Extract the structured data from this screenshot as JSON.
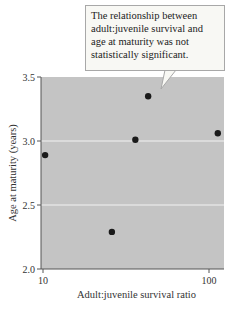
{
  "chart_data": {
    "type": "scatter",
    "title": "",
    "xlabel": "Adult:juvenile survival ratio",
    "ylabel": "Age at maturity (years)",
    "xscale": "log",
    "xlim": [
      10,
      120
    ],
    "ylim": [
      2.0,
      3.5
    ],
    "xticks": [
      10,
      100
    ],
    "xtick_labels": [
      "10",
      "100"
    ],
    "yticks": [
      2.0,
      2.5,
      3.0,
      3.5
    ],
    "ytick_labels": [
      "2.0",
      "2.5",
      "3.0",
      "3.5"
    ],
    "grid": "horizontal at 2.5 and 3.0",
    "points": [
      {
        "x": 10.3,
        "y": 2.89
      },
      {
        "x": 26,
        "y": 2.29
      },
      {
        "x": 36,
        "y": 3.01
      },
      {
        "x": 43,
        "y": 3.35
      },
      {
        "x": 113,
        "y": 3.06
      }
    ],
    "annotation": "The relationship between adult:juvenile survival and age at maturity was not statistically significant.",
    "colors": {
      "plot_bg": "#c4c4c4",
      "point": "#1a1a1a",
      "grid": "#f2f2f2",
      "callout_bg": "#f8f8f4",
      "callout_border": "#a8a8a8"
    }
  }
}
